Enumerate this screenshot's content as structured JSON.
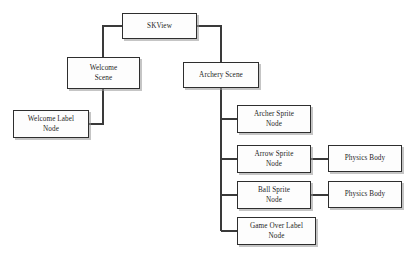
{
  "diagram": {
    "background_color": "#ffffff",
    "box_fill_color": "#fdfdfd",
    "box_border_color": "#2e2e2e",
    "connector_color": "#3a3a3a",
    "text_color": "#1d1d1d",
    "nodes": {
      "skview": "SKView",
      "welcome_scene": "Welcome\nScene",
      "archery_scene": "Archery Scene",
      "welcome_label_node": "Welcome Label\nNode",
      "archer_sprite_node": "Archer Sprite\nNode",
      "arrow_sprite_node": "Arrow Sprite\nNode",
      "ball_sprite_node": "Ball Sprite\nNode",
      "game_over_label_node": "Game Over Label\nNode",
      "physics_body_arrow": "Physics Body",
      "physics_body_ball": "Physics Body"
    },
    "edges": [
      {
        "from": "skview",
        "to": "welcome_scene"
      },
      {
        "from": "skview",
        "to": "archery_scene"
      },
      {
        "from": "welcome_scene",
        "to": "welcome_label_node"
      },
      {
        "from": "archery_scene",
        "to": "archer_sprite_node"
      },
      {
        "from": "archery_scene",
        "to": "arrow_sprite_node"
      },
      {
        "from": "archery_scene",
        "to": "ball_sprite_node"
      },
      {
        "from": "archery_scene",
        "to": "game_over_label_node"
      },
      {
        "from": "arrow_sprite_node",
        "to": "physics_body_arrow"
      },
      {
        "from": "ball_sprite_node",
        "to": "physics_body_ball"
      }
    ]
  }
}
